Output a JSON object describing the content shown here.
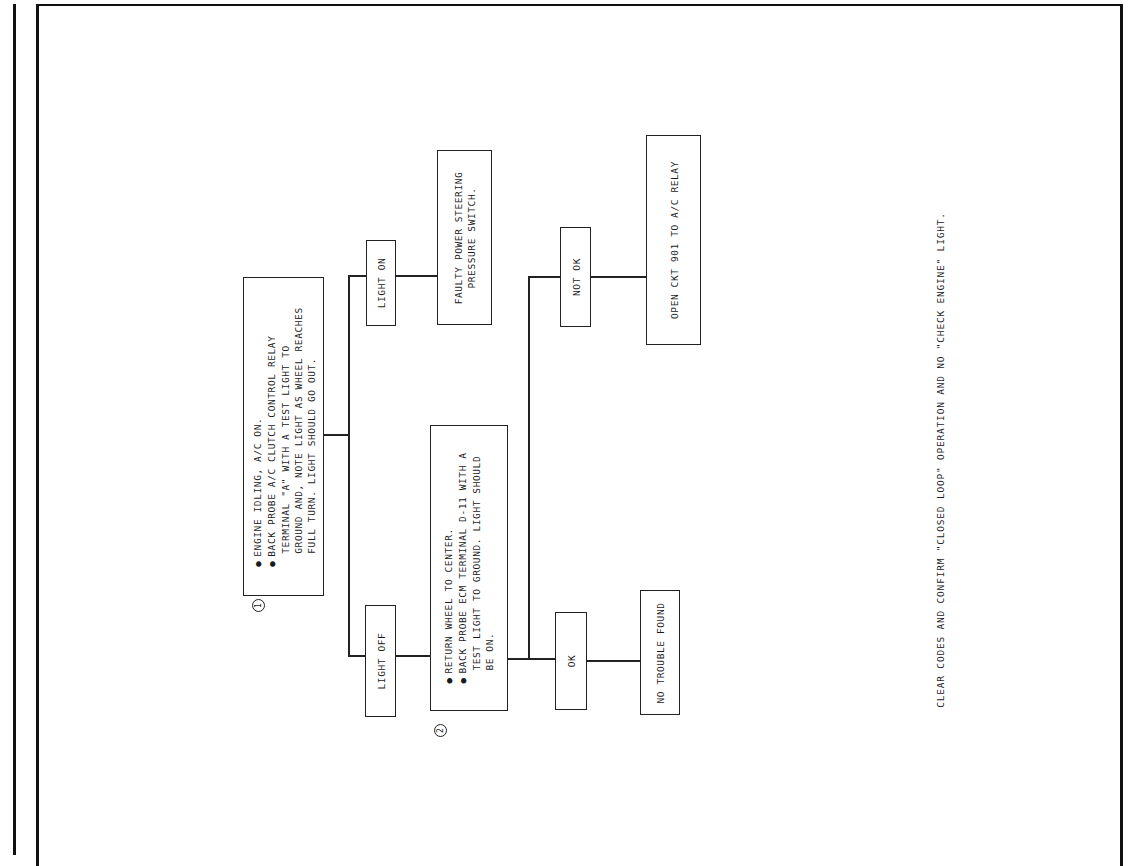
{
  "diagram": {
    "type": "troubleshooting-flowchart",
    "orientation": "rotated-90-ccw",
    "steps": [
      {
        "marker": "1",
        "lines": [
          "ENGINE IDLING, A/C ON.",
          "BACK PROBE A/C CLUTCH CONTROL RELAY",
          "TERMINAL \"A\" WITH A TEST LIGHT TO",
          "GROUND AND, NOTE LIGHT AS WHEEL REACHES",
          "FULL TURN.  LIGHT SHOULD GO OUT."
        ],
        "bullets": [
          0,
          1
        ]
      },
      {
        "marker": "2",
        "lines": [
          "RETURN WHEEL TO CENTER.",
          "BACK PROBE ECM TERMINAL D-11 WITH A",
          "TEST LIGHT TO GROUND.  LIGHT SHOULD",
          "BE ON."
        ],
        "bullets": [
          0,
          1
        ]
      }
    ],
    "branches": {
      "light_on": "LIGHT ON",
      "light_off": "LIGHT OFF",
      "not_ok": "NOT OK",
      "ok": "OK"
    },
    "results": {
      "faulty_switch": [
        "FAULTY POWER STEERING",
        "PRESSURE SWITCH."
      ],
      "open_circuit": "OPEN CKT 901 TO A/C RELAY",
      "no_trouble": "NO TROUBLE FOUND"
    },
    "footer": "CLEAR CODES AND CONFIRM \"CLOSED LOOP\" OPERATION AND NO \"CHECK ENGINE\" LIGHT."
  }
}
